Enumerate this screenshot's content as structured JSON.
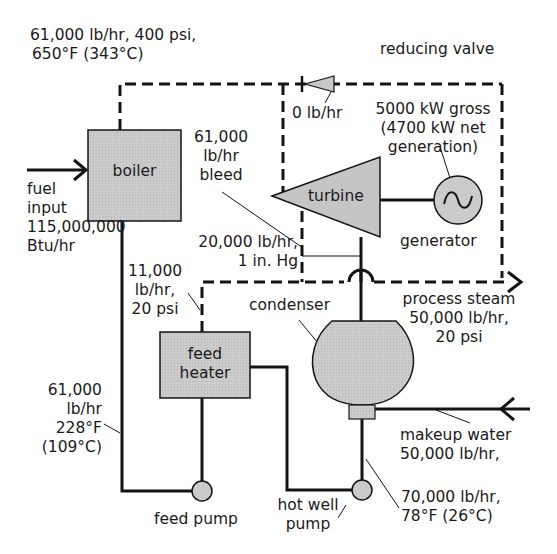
{
  "diagram": {
    "colors": {
      "line": "#141414",
      "component_fill": "#c8c8c8",
      "background": "#ffffff"
    },
    "labels": {
      "boiler_outlet": [
        "61,000 lb/hr, 400 psi,",
        "650°F (343°C)"
      ],
      "reducing_valve": "reducing valve",
      "bypass_flow": "0 lb/hr",
      "turbine_output": [
        "5000 kW gross",
        "(4700 kW net",
        "generation)"
      ],
      "bleed": [
        "61,000",
        "lb/hr",
        "bleed"
      ],
      "fuel_input": [
        "fuel",
        "input",
        "115,000,000",
        "Btu/hr"
      ],
      "exhaust": [
        "20,000 lb/hr,",
        "1 in. Hg"
      ],
      "extraction_to_heater": [
        "11,000",
        "lb/hr,",
        "20 psi"
      ],
      "process_steam": [
        "process steam",
        "50,000 lb/hr,",
        "20 psi"
      ],
      "feedwater": [
        "61,000",
        "lb/hr",
        "228°F",
        "(109°C)"
      ],
      "makeup_water": [
        "makeup water",
        "50,000 lb/hr,"
      ],
      "condensate": [
        "70,000 lb/hr,",
        "78°F (26°C)"
      ]
    },
    "components": {
      "boiler": "boiler",
      "turbine": "turbine",
      "generator": "generator",
      "condenser": "condenser",
      "feed_heater": [
        "feed",
        "heater"
      ],
      "feed_pump": "feed pump",
      "hot_well_pump": [
        "hot well",
        "pump"
      ]
    },
    "icons": {
      "generator_symbol": "~"
    }
  }
}
